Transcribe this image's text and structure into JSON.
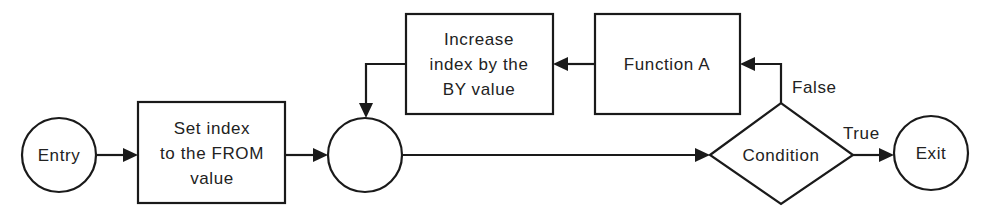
{
  "diagram": {
    "type": "flowchart",
    "title": "",
    "nodes": [
      {
        "id": "entry",
        "shape": "circle",
        "lines": [
          "Entry"
        ]
      },
      {
        "id": "set_index",
        "shape": "rectangle",
        "lines": [
          "Set index",
          "to the FROM",
          "value"
        ]
      },
      {
        "id": "junction",
        "shape": "circle",
        "lines": []
      },
      {
        "id": "increase_index",
        "shape": "rectangle",
        "lines": [
          "Increase",
          "index by the",
          "BY value"
        ]
      },
      {
        "id": "function_a",
        "shape": "rectangle",
        "lines": [
          "Function A"
        ]
      },
      {
        "id": "condition",
        "shape": "diamond",
        "lines": [
          "Condition"
        ]
      },
      {
        "id": "exit",
        "shape": "circle",
        "lines": [
          "Exit"
        ]
      }
    ],
    "edges": [
      {
        "from": "entry",
        "to": "set_index",
        "label": ""
      },
      {
        "from": "set_index",
        "to": "junction",
        "label": ""
      },
      {
        "from": "junction",
        "to": "condition",
        "label": ""
      },
      {
        "from": "condition",
        "to": "exit",
        "label": "True"
      },
      {
        "from": "condition",
        "to": "function_a",
        "label": "False"
      },
      {
        "from": "function_a",
        "to": "increase_index",
        "label": ""
      },
      {
        "from": "increase_index",
        "to": "junction",
        "label": ""
      }
    ],
    "edge_labels": {
      "true": "True",
      "false": "False"
    },
    "colors": {
      "stroke": "#1a1a1a",
      "text": "#222222",
      "background": "#ffffff"
    }
  }
}
